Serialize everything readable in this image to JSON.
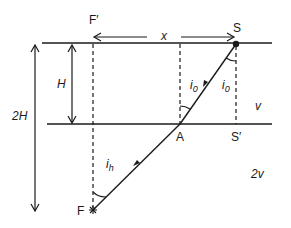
{
  "diagram": {
    "labels": {
      "f_prime": "F′",
      "s": "S",
      "x": "x",
      "h": "H",
      "two_h": "2H",
      "i0_left": "i",
      "i0_left_sub": "0",
      "i0_right": "i",
      "i0_right_sub": "0",
      "ih": "i",
      "ih_sub": "h",
      "v": "v",
      "a": "A",
      "s_prime": "S′",
      "f": "F",
      "two_v": "2v"
    },
    "colors": {
      "ink": "#1a1a1a",
      "background": "#ffffff"
    }
  }
}
